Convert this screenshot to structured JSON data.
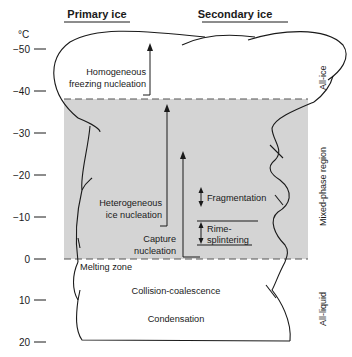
{
  "headers": {
    "primary": "Primary ice",
    "secondary": "Secondary ice"
  },
  "axis": {
    "unit": "°C",
    "ticks": [
      {
        "label": "−50",
        "y": 49
      },
      {
        "label": "−40",
        "y": 91
      },
      {
        "label": "−30",
        "y": 133
      },
      {
        "label": "−20",
        "y": 175
      },
      {
        "label": "−10",
        "y": 217
      },
      {
        "label": "0",
        "y": 259
      },
      {
        "label": "10",
        "y": 300
      },
      {
        "label": "20",
        "y": 342
      }
    ]
  },
  "regions": {
    "all_ice": "All-ice",
    "mixed_phase": "Mixed-phase region",
    "all_liquid": "All-liquid"
  },
  "processes": {
    "homogeneous_line1": "Homogeneous",
    "homogeneous_line2": "freezing nucleation",
    "heterogeneous_line1": "Heterogeneous",
    "heterogeneous_line2": "ice nucleation",
    "capture_line1": "Capture",
    "capture_line2": "nucleation",
    "fragmentation": "Fragmentation",
    "rime_line1": "Rime-",
    "rime_line2": "splintering",
    "melting_zone": "Melting zone",
    "collision": "Collision-coalescence",
    "condensation": "Condensation"
  },
  "colors": {
    "mixed_phase_fill": "#d4d4d4",
    "line": "#1a1a1a"
  }
}
